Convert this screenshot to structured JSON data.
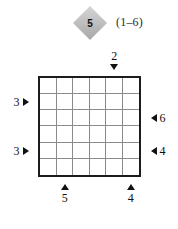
{
  "puzzle": {
    "badge_value": "5",
    "range_label": "(1–6)",
    "grid": {
      "rows": 6,
      "cols": 6,
      "cells": [
        [
          "",
          "",
          "",
          "",
          "",
          ""
        ],
        [
          "",
          "",
          "",
          "",
          "",
          ""
        ],
        [
          "",
          "",
          "",
          "",
          "",
          ""
        ],
        [
          "",
          "",
          "",
          "",
          "",
          ""
        ],
        [
          "",
          "",
          "",
          "",
          "",
          ""
        ],
        [
          "",
          "",
          "",
          "",
          "",
          ""
        ]
      ]
    },
    "clues": {
      "top": [
        {
          "value": "2",
          "column": 5,
          "direction": "down"
        }
      ],
      "bottom": [
        {
          "value": "5",
          "column": 2,
          "direction": "up"
        },
        {
          "value": "4",
          "column": 6,
          "direction": "up"
        }
      ],
      "left": [
        {
          "value": "3",
          "row": 2,
          "direction": "right"
        },
        {
          "value": "3",
          "row": 5,
          "direction": "right"
        }
      ],
      "right": [
        {
          "value": "6",
          "row": 3,
          "direction": "left"
        },
        {
          "value": "4",
          "row": 5,
          "direction": "left"
        }
      ]
    },
    "colors": {
      "badge_fill": "#bcbcbc",
      "border": "#1c1c1c",
      "gridline": "#8a8a8a",
      "text": "#111111",
      "background": "#ffffff"
    }
  }
}
